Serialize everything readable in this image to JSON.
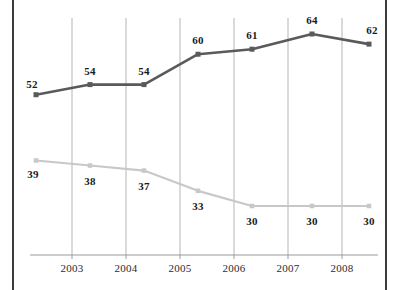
{
  "chart_data": {
    "type": "line",
    "title": "",
    "subtitle": "",
    "xlabel": "",
    "ylabel": "",
    "grid": "vertical",
    "legend": "none",
    "xlim": [
      0,
      7
    ],
    "ylim": [
      25,
      70
    ],
    "x": [
      2002.4,
      2003.2,
      2004.2,
      2005.2,
      2006.2,
      2007.2,
      2008.2
    ],
    "categories": [
      "",
      "2003",
      "2004",
      "2005",
      "2006",
      "2007",
      "2008"
    ],
    "tick_labels": [
      "2003",
      "2004",
      "2005",
      "2006",
      "2007",
      "2008"
    ],
    "series": [
      {
        "name": "upper-series",
        "color": "#5a5a5a",
        "marker": "square",
        "label_position": "above",
        "values": [
          52,
          54,
          54,
          60,
          61,
          64,
          62
        ]
      },
      {
        "name": "lower-series",
        "color": "#c8c8c8",
        "marker": "square",
        "label_position": "below",
        "values": [
          39,
          38,
          37,
          33,
          30,
          30,
          30
        ]
      }
    ]
  },
  "frame": {
    "border_color": "#3c3c3c",
    "background": "#ffffff"
  },
  "axis": {
    "line_color": "#9a9a9a",
    "gridline_color": "#b5b5b5"
  }
}
